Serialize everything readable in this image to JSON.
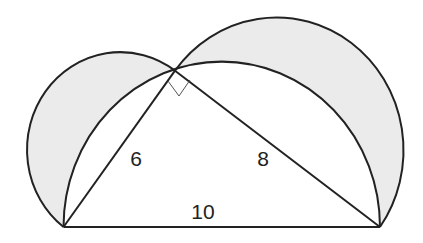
{
  "diagram": {
    "labels": {
      "leg_left": "6",
      "leg_right": "8",
      "hypotenuse": "10"
    },
    "right_angle_marker": true,
    "colors": {
      "stroke": "#222222",
      "shaded_fill": "#ebebeb",
      "background": "#ffffff"
    }
  }
}
